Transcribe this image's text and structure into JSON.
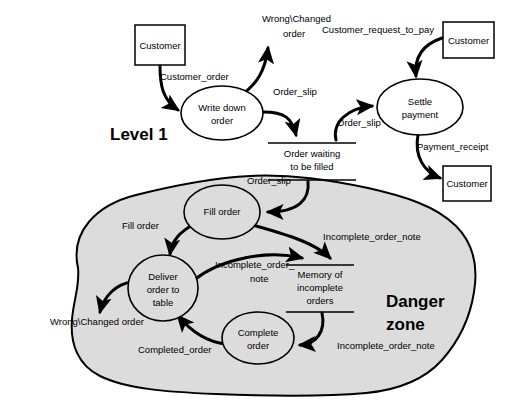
{
  "diagram": {
    "headings": [
      {
        "id": "level1",
        "text": "Level 1",
        "x": 110,
        "y": 140
      },
      {
        "id": "danger-line1",
        "text": "Danger",
        "x": 386,
        "y": 307
      },
      {
        "id": "danger-line2",
        "text": "zone",
        "x": 386,
        "y": 330
      }
    ],
    "external_entities": [
      {
        "id": "customer-order-source",
        "label": "Customer",
        "x": 135,
        "y": 25,
        "w": 50,
        "h": 40
      },
      {
        "id": "customer-pay-request",
        "label": "Customer",
        "x": 443,
        "y": 22,
        "w": 51,
        "h": 36
      },
      {
        "id": "customer-receipt",
        "label": "Customer",
        "x": 443,
        "y": 166,
        "w": 48,
        "h": 35
      }
    ],
    "processes": [
      {
        "id": "write-down-order",
        "lines": [
          "Write down",
          "order"
        ],
        "cx": 222,
        "cy": 113,
        "rx": 41,
        "ry": 27,
        "shaded": false
      },
      {
        "id": "settle-payment",
        "lines": [
          "Settle",
          "payment"
        ],
        "cx": 420,
        "cy": 107,
        "rx": 43,
        "ry": 28,
        "shaded": false
      },
      {
        "id": "fill-order",
        "lines": [
          "Fill order"
        ],
        "cx": 222,
        "cy": 212,
        "rx": 38,
        "ry": 27,
        "shaded": true
      },
      {
        "id": "deliver-order-to-table",
        "lines": [
          "Deliver",
          "order to",
          "table"
        ],
        "cx": 163,
        "cy": 288,
        "rx": 35,
        "ry": 33,
        "shaded": true
      },
      {
        "id": "complete-order",
        "lines": [
          "Complete",
          "order"
        ],
        "cx": 258,
        "cy": 338,
        "rx": 36,
        "ry": 26,
        "shaded": true
      }
    ],
    "data_stores": [
      {
        "id": "order-waiting-to-be-filled",
        "lines": [
          "Order waiting",
          "to be filled"
        ],
        "cx": 312,
        "top": 143,
        "bottom": 180,
        "half_width": 44
      },
      {
        "id": "memory-of-incomplete-orders",
        "lines": [
          "Memory of",
          "incomplete",
          "orders"
        ],
        "cx": 320,
        "top": 265,
        "bottom": 312,
        "half_width": 34
      }
    ],
    "flow_labels": [
      {
        "id": "customer-order",
        "text": "Customer_order",
        "x": 160,
        "y": 80,
        "anchor": "start"
      },
      {
        "id": "wrong-changed-order-top-1",
        "text": "Wrong\\Changed",
        "x": 262,
        "y": 22,
        "anchor": "start"
      },
      {
        "id": "wrong-changed-order-top-2",
        "text": "order",
        "x": 283,
        "y": 37,
        "anchor": "start"
      },
      {
        "id": "order-slip-top",
        "text": "Order_slip",
        "x": 273,
        "y": 95,
        "anchor": "start"
      },
      {
        "id": "customer-request-to-pay",
        "text": "Customer_request_to_pay",
        "x": 322,
        "y": 33,
        "anchor": "start"
      },
      {
        "id": "order-slip-to-settle",
        "text": "Order_slip",
        "x": 337,
        "y": 126,
        "anchor": "start"
      },
      {
        "id": "payment-receipt",
        "text": "Payment_receipt",
        "x": 417,
        "y": 150,
        "anchor": "start"
      },
      {
        "id": "order-slip-to-fill",
        "text": "Order_slip",
        "x": 247,
        "y": 184,
        "anchor": "start"
      },
      {
        "id": "fill-order-flow",
        "text": "Fill order",
        "x": 122,
        "y": 229,
        "anchor": "start"
      },
      {
        "id": "incomplete-order-note-fill",
        "text": "Incomplete_order_note",
        "x": 323,
        "y": 240,
        "anchor": "start"
      },
      {
        "id": "incomplete-order-note-deliver-1",
        "text": "Incomplete_order_",
        "x": 215,
        "y": 268,
        "anchor": "start"
      },
      {
        "id": "incomplete-order-note-deliver-2",
        "text": "note",
        "x": 250,
        "y": 282,
        "anchor": "start"
      },
      {
        "id": "incomplete-order-note-complete",
        "text": "Incomplete_order_note",
        "x": 337,
        "y": 349,
        "anchor": "start"
      },
      {
        "id": "completed-order",
        "text": "Completed_order",
        "x": 138,
        "y": 353,
        "anchor": "start"
      },
      {
        "id": "wrong-changed-order-bottom",
        "text": "Wrong\\Changed order",
        "x": 50,
        "y": 325,
        "anchor": "start"
      }
    ],
    "colors": {
      "background": "#ffffff",
      "shaded_fill": "#dcdcdc",
      "stroke": "#000000"
    }
  }
}
